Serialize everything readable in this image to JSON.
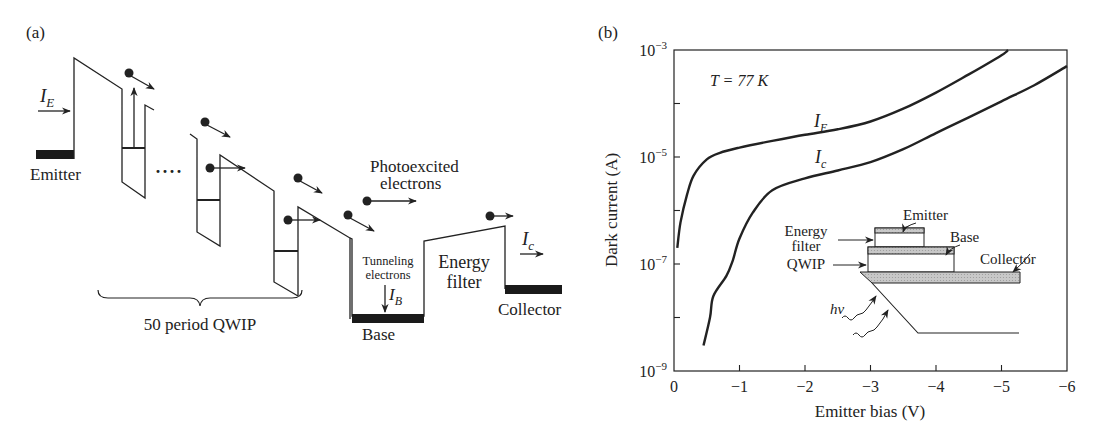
{
  "panel_a": {
    "label": "(a)",
    "current_emitter": {
      "symbol": "I",
      "sub": "E"
    },
    "current_collector": {
      "symbol": "I",
      "sub": "c"
    },
    "current_base": {
      "symbol": "I",
      "sub": "B"
    },
    "emitter_label": "Emitter",
    "ellipsis": "····",
    "photoexcited_label_line1": "Photoexcited",
    "photoexcited_label_line2": "electrons",
    "tunneling_label_line1": "Tunneling",
    "tunneling_label_line2": "electrons",
    "energy_filter_line1": "Energy",
    "energy_filter_line2": "filter",
    "collector_label": "Collector",
    "base_label": "Base",
    "period_label": "50 period QWIP"
  },
  "panel_b": {
    "label": "(b)",
    "temperature_label": "T = 77 K",
    "curve_labels": {
      "emitter": {
        "symbol": "I",
        "sub": "E"
      },
      "collector": {
        "symbol": "I",
        "sub": "c"
      }
    },
    "inset": {
      "emitter": "Emitter",
      "base": "Base",
      "collector": "Collector",
      "energy_filter_line1": "Energy",
      "energy_filter_line2": "filter",
      "qwip": "QWIP",
      "photon": "hν"
    }
  },
  "chart_data": {
    "type": "line",
    "title": "",
    "annotation": "T = 77 K",
    "xlabel": "Emitter bias (V)",
    "ylabel": "Dark current (A)",
    "xlim": [
      0,
      -6
    ],
    "ylim": [
      1e-09,
      0.001
    ],
    "yscale": "log",
    "x_ticks": [
      "0",
      "−1",
      "−2",
      "−3",
      "−4",
      "−5",
      "−6"
    ],
    "y_ticks": [
      "10^-9",
      "10^-7",
      "10^-5",
      "10^-3"
    ],
    "grid": false,
    "legend": "inline labels",
    "series": [
      {
        "name": "I_E",
        "x": [
          -0.05,
          -0.1,
          -0.2,
          -0.3,
          -0.5,
          -0.7,
          -1.0,
          -1.5,
          -2.0,
          -2.5,
          -3.0,
          -3.5,
          -4.0,
          -4.5,
          -5.0,
          -5.1
        ],
        "y": [
          2e-07,
          6e-07,
          2e-06,
          4.5e-06,
          9e-06,
          1.2e-05,
          1.5e-05,
          2e-05,
          2.6e-05,
          3.3e-05,
          4.6e-05,
          8e-05,
          0.00016,
          0.00035,
          0.0008,
          0.001
        ]
      },
      {
        "name": "I_c",
        "x": [
          -0.45,
          -0.55,
          -0.6,
          -0.8,
          -0.9,
          -1.0,
          -1.2,
          -1.5,
          -2.0,
          -2.5,
          -3.0,
          -3.5,
          -4.0,
          -4.5,
          -5.0,
          -5.5,
          -6.0
        ],
        "y": [
          3e-09,
          1e-08,
          2.5e-08,
          6e-08,
          1.2e-07,
          3e-07,
          9e-07,
          2.4e-06,
          4e-06,
          5.6e-06,
          8e-06,
          1.4e-05,
          2.8e-05,
          5.5e-05,
          0.00011,
          0.00022,
          0.0005
        ]
      }
    ]
  }
}
